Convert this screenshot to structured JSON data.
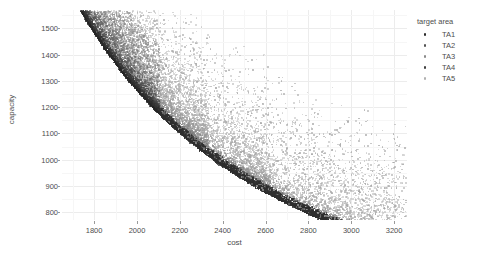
{
  "chart_data": {
    "type": "scatter",
    "title": "",
    "xlabel": "cost",
    "ylabel": "capacity",
    "xlim": [
      1650,
      3260
    ],
    "ylim": [
      770,
      1570
    ],
    "xticks": [
      1800,
      2000,
      2200,
      2400,
      2600,
      2800,
      3000,
      3200
    ],
    "yticks": [
      800,
      900,
      1000,
      1100,
      1200,
      1300,
      1400,
      1500
    ],
    "xtick_labels": [
      "1800",
      "2000",
      "2200",
      "2400",
      "2600",
      "2800",
      "3000",
      "3200"
    ],
    "ytick_labels": [
      "800",
      "900",
      "1000",
      "1100",
      "1200",
      "1300",
      "1400",
      "1500"
    ],
    "grid": true,
    "grid_minor": true,
    "legend_title": "target area",
    "legend_position": "right",
    "series": [
      {
        "name": "TA1",
        "color": "#2b2b2b",
        "n_points": 900,
        "description": "darkest cluster forming the lower-right Pareto tail from cost 2450 to 3210, capacity 820-1000"
      },
      {
        "name": "TA2",
        "color": "#545454",
        "n_points": 900,
        "description": "dark band along the mid frontier, cost 2050-2600, capacity 950-1200"
      },
      {
        "name": "TA3",
        "color": "#7d7d7d",
        "n_points": 900,
        "description": "mid-gray band, cost 1850-2300, capacity 1120-1400"
      },
      {
        "name": "TA4",
        "color": "#3f3f3f",
        "n_points": 900,
        "description": "dense dark wedge at upper left, cost 1680-2050, capacity 1300-1560"
      },
      {
        "name": "TA5",
        "color": "#a8a8a8",
        "n_points": 900,
        "description": "light gray diffuse scatter spread above the frontier across the full range"
      }
    ],
    "shape": "dense hyperbolic Pareto frontier; sharp lower-left boundary with diffuse upper tail"
  },
  "legend": {
    "title": "target area",
    "items": [
      {
        "label": "TA1",
        "color": "#2b2b2b"
      },
      {
        "label": "TA2",
        "color": "#545454"
      },
      {
        "label": "TA3",
        "color": "#8a8a8a"
      },
      {
        "label": "TA4",
        "color": "#3f3f3f"
      },
      {
        "label": "TA5",
        "color": "#b0b0b0"
      }
    ]
  },
  "colors": {
    "background": "#ffffff",
    "grid_major": "#ececec",
    "grid_minor": "#f6f6f6",
    "text": "#4d4d4d",
    "tickmark": "#9a9a9a"
  }
}
